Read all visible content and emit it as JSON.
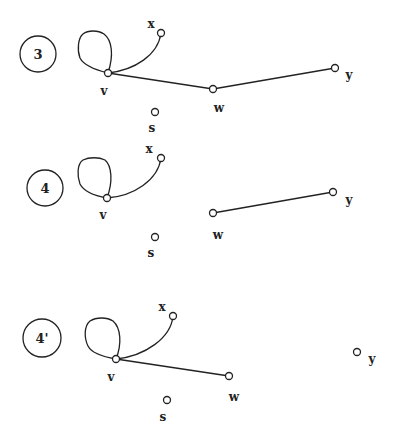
{
  "panels": [
    {
      "id": "3",
      "label": "3",
      "nodes": {
        "v": "v",
        "x": "x",
        "w": "w",
        "y": "y",
        "s": "s"
      },
      "edges": [
        "v-v (loop)",
        "v-x (curve)",
        "v-w",
        "w-y"
      ]
    },
    {
      "id": "4",
      "label": "4",
      "nodes": {
        "v": "v",
        "x": "x",
        "w": "w",
        "y": "y",
        "s": "s"
      },
      "edges": [
        "v-v (loop)",
        "v-x (curve)",
        "w-y"
      ]
    },
    {
      "id": "4prime",
      "label": "4'",
      "nodes": {
        "v": "v",
        "x": "x",
        "w": "w",
        "y": "y",
        "s": "s"
      },
      "edges": [
        "v-v (loop)",
        "v-x (curve)",
        "v-w"
      ]
    }
  ],
  "colors": {
    "stroke": "#222222",
    "background": "#ffffff"
  }
}
